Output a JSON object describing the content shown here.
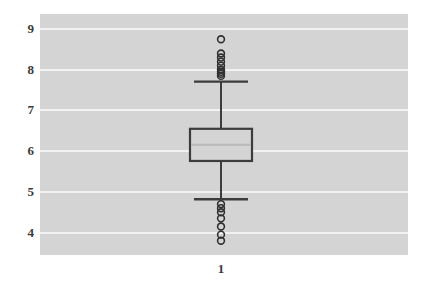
{
  "chart_data": {
    "type": "box",
    "title": "",
    "xlabel": "",
    "ylabel": "",
    "categories": [
      "1"
    ],
    "ylim": [
      3.45,
      9.37
    ],
    "yticks": [
      9,
      8,
      7,
      6,
      5,
      4
    ],
    "ytick_labels": [
      "9",
      "8",
      "7",
      "6",
      "5",
      "4"
    ],
    "xtick_labels": [
      "1"
    ],
    "grid": true,
    "grid_axis": "y",
    "grid_color": "#f2f2f2",
    "plot_background": "#d4d4d4",
    "figure_background": "#ffffff",
    "box_edge_color": "#3c3c3c",
    "median_color": "#b9b9b9",
    "outlier_marker": "circle-open",
    "series": [
      {
        "name": "1",
        "position": 1,
        "q1": 5.76,
        "median": 6.16,
        "q3": 6.55,
        "whisker_low": 4.82,
        "whisker_high": 7.71,
        "outliers_high": [
          8.75,
          8.4,
          8.3,
          8.2,
          8.1,
          8.0,
          7.95,
          7.9,
          7.85
        ],
        "outliers_low": [
          4.7,
          4.6,
          4.5,
          4.35,
          4.15,
          3.95,
          3.8
        ]
      }
    ]
  },
  "axes": {
    "y_tick_positions_px": [
      29,
      67,
      105,
      143,
      181,
      219
    ],
    "x_tick_positions_px": [
      221
    ]
  }
}
